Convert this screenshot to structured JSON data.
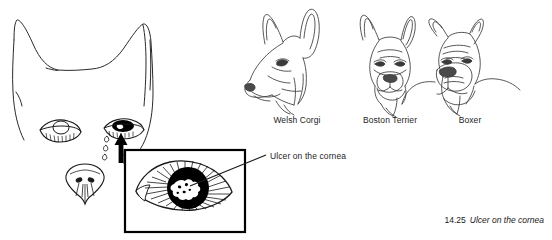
{
  "figure": {
    "number": "14.25",
    "caption": "Ulcer on the cornea",
    "callout_label": "Ulcer on the cornea"
  },
  "breeds": [
    {
      "label": "Welsh Corgi"
    },
    {
      "label": "Boston Terrier"
    },
    {
      "label": "Boxer"
    }
  ],
  "colors": {
    "ink": "#1a1a1a",
    "background": "#ffffff",
    "fill_dark": "#000000"
  },
  "diagram": {
    "main_head": "dog-head-front-outline",
    "healthy_eye": "normal-eye",
    "affected_eye": "ulcerated-eye",
    "tears": "tear-drops",
    "nose": "dog-nose",
    "inset": "magnified-eye-detail",
    "pointer": "arrow-up"
  }
}
